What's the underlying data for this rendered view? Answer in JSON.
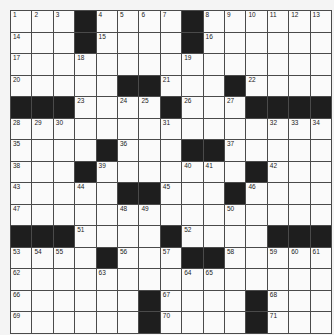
{
  "puzzle": {
    "type": "crossword",
    "rows": 15,
    "cols": 15,
    "colors": {
      "block": "#1e1e1e",
      "cell": "#fafafa",
      "line": "#4a4a4a",
      "background": "#f4f4f4"
    },
    "layout": [
      "...#....#......",
      "...#....#......",
      "...............",
      ".....##..#.....",
      "###..#.#..#.###",
      "...............",
      "....#...##.....",
      "...#.......#...",
      ".....##...#....",
      "...............",
      "###....#....###",
      "....#..#..#....",
      "...............",
      "......#....#...",
      "......#....#..."
    ],
    "numbers": [
      {
        "r": 0,
        "c": 0,
        "n": "1"
      },
      {
        "r": 0,
        "c": 1,
        "n": "2"
      },
      {
        "r": 0,
        "c": 2,
        "n": "3"
      },
      {
        "r": 0,
        "c": 4,
        "n": "4"
      },
      {
        "r": 0,
        "c": 5,
        "n": "5"
      },
      {
        "r": 0,
        "c": 6,
        "n": "6"
      },
      {
        "r": 0,
        "c": 7,
        "n": "7"
      },
      {
        "r": 0,
        "c": 9,
        "n": "8"
      },
      {
        "r": 0,
        "c": 10,
        "n": "9"
      },
      {
        "r": 0,
        "c": 11,
        "n": "10"
      },
      {
        "r": 0,
        "c": 12,
        "n": "11"
      },
      {
        "r": 0,
        "c": 13,
        "n": "12"
      },
      {
        "r": 0,
        "c": 14,
        "n": "13"
      },
      {
        "r": 1,
        "c": 0,
        "n": "14"
      },
      {
        "r": 1,
        "c": 4,
        "n": "15"
      },
      {
        "r": 1,
        "c": 9,
        "n": "16"
      },
      {
        "r": 2,
        "c": 0,
        "n": "17"
      },
      {
        "r": 2,
        "c": 3,
        "n": "18"
      },
      {
        "r": 2,
        "c": 8,
        "n": "19"
      },
      {
        "r": 3,
        "c": 0,
        "n": "20"
      },
      {
        "r": 3,
        "c": 7,
        "n": "21"
      },
      {
        "r": 3,
        "c": 11,
        "n": "22"
      },
      {
        "r": 4,
        "c": 3,
        "n": "23"
      },
      {
        "r": 4,
        "c": 5,
        "n": "24"
      },
      {
        "r": 4,
        "c": 6,
        "n": "25"
      },
      {
        "r": 4,
        "c": 8,
        "n": "26"
      },
      {
        "r": 4,
        "c": 10,
        "n": "27"
      },
      {
        "r": 5,
        "c": 0,
        "n": "28"
      },
      {
        "r": 5,
        "c": 1,
        "n": "29"
      },
      {
        "r": 5,
        "c": 2,
        "n": "30"
      },
      {
        "r": 5,
        "c": 7,
        "n": "31"
      },
      {
        "r": 5,
        "c": 12,
        "n": "32"
      },
      {
        "r": 5,
        "c": 13,
        "n": "33"
      },
      {
        "r": 5,
        "c": 14,
        "n": "34"
      },
      {
        "r": 6,
        "c": 0,
        "n": "35"
      },
      {
        "r": 6,
        "c": 5,
        "n": "36"
      },
      {
        "r": 6,
        "c": 10,
        "n": "37"
      },
      {
        "r": 7,
        "c": 0,
        "n": "38"
      },
      {
        "r": 7,
        "c": 4,
        "n": "39"
      },
      {
        "r": 7,
        "c": 8,
        "n": "40"
      },
      {
        "r": 7,
        "c": 9,
        "n": "41"
      },
      {
        "r": 7,
        "c": 12,
        "n": "42"
      },
      {
        "r": 8,
        "c": 0,
        "n": "43"
      },
      {
        "r": 8,
        "c": 3,
        "n": "44"
      },
      {
        "r": 8,
        "c": 7,
        "n": "45"
      },
      {
        "r": 8,
        "c": 11,
        "n": "46"
      },
      {
        "r": 9,
        "c": 0,
        "n": "47"
      },
      {
        "r": 9,
        "c": 5,
        "n": "48"
      },
      {
        "r": 9,
        "c": 6,
        "n": "49"
      },
      {
        "r": 9,
        "c": 10,
        "n": "50"
      },
      {
        "r": 10,
        "c": 3,
        "n": "51"
      },
      {
        "r": 10,
        "c": 8,
        "n": "52"
      },
      {
        "r": 11,
        "c": 0,
        "n": "53"
      },
      {
        "r": 11,
        "c": 1,
        "n": "54"
      },
      {
        "r": 11,
        "c": 2,
        "n": "55"
      },
      {
        "r": 11,
        "c": 5,
        "n": "56"
      },
      {
        "r": 11,
        "c": 7,
        "n": "57"
      },
      {
        "r": 11,
        "c": 10,
        "n": "58"
      },
      {
        "r": 11,
        "c": 12,
        "n": "59"
      },
      {
        "r": 11,
        "c": 13,
        "n": "60"
      },
      {
        "r": 11,
        "c": 14,
        "n": "61"
      },
      {
        "r": 12,
        "c": 0,
        "n": "62"
      },
      {
        "r": 12,
        "c": 4,
        "n": "63"
      },
      {
        "r": 12,
        "c": 8,
        "n": "64"
      },
      {
        "r": 12,
        "c": 9,
        "n": "65"
      },
      {
        "r": 13,
        "c": 0,
        "n": "66"
      },
      {
        "r": 13,
        "c": 7,
        "n": "67"
      },
      {
        "r": 13,
        "c": 12,
        "n": "68"
      },
      {
        "r": 14,
        "c": 0,
        "n": "69"
      },
      {
        "r": 14,
        "c": 7,
        "n": "70"
      },
      {
        "r": 14,
        "c": 12,
        "n": "71"
      }
    ]
  }
}
